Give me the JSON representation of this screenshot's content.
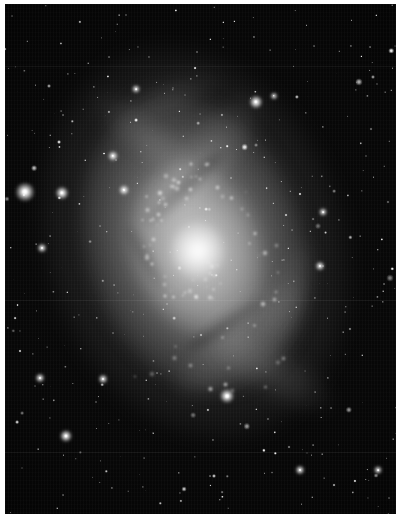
{
  "image": {
    "kind": "astronomical-photograph",
    "subject": "spiral galaxy",
    "common_name": "Triangulum Galaxy",
    "catalog_designation": "M33",
    "color_mode": "grayscale",
    "caption": "",
    "width_px": 404,
    "height_px": 521
  },
  "frame": {
    "border_color": "#ffffff",
    "border_left_px": 5,
    "border_top_px": 4,
    "border_right_px": 8,
    "border_bottom_px": 7,
    "sky_background_color": "#000000"
  },
  "palette": {
    "sky": "#000000",
    "sky_noise": "#0a0a0a",
    "galaxy_outer_halo": "#6a6a6a",
    "galaxy_mid_disk": "#a8a8a8",
    "galaxy_inner_disk": "#d2d2d2",
    "galaxy_core": "#ffffff",
    "dust_lane": "#1a1a1a",
    "star_white": "#ffffff"
  },
  "galaxy": {
    "label": "M33 spiral galaxy",
    "center_x": 196,
    "center_y": 258,
    "major_axis_px": 300,
    "minor_axis_px": 212,
    "position_angle_deg": -18,
    "core": {
      "label": "galactic nucleus",
      "x": 196,
      "y": 253,
      "radius_px": 22,
      "peak_brightness": 255
    },
    "arms": [
      {
        "name": "north-east arm",
        "cx": 52,
        "cy": 30,
        "w": 150,
        "h": 58,
        "rot": -52,
        "opacity": 0.44
      },
      {
        "name": "north-west arm",
        "cx": 36,
        "cy": 26,
        "w": 126,
        "h": 46,
        "rot": 38,
        "opacity": 0.4
      },
      {
        "name": "south-west arm",
        "cx": 60,
        "cy": 66,
        "w": 162,
        "h": 60,
        "rot": -40,
        "opacity": 0.42
      },
      {
        "name": "south-east arm",
        "cx": 68,
        "cy": 72,
        "w": 140,
        "h": 52,
        "rot": 30,
        "opacity": 0.38
      },
      {
        "name": "outer eastern arm",
        "cx": 72,
        "cy": 58,
        "w": 118,
        "h": 44,
        "rot": -70,
        "opacity": 0.3
      },
      {
        "name": "outer northern spur",
        "cx": 42,
        "cy": 18,
        "w": 104,
        "h": 38,
        "rot": -18,
        "opacity": 0.28
      }
    ],
    "dust_lanes": [
      {
        "name": "inner north dust lane",
        "cx": 46,
        "cy": 36,
        "w": 104,
        "h": 17,
        "rot": -44
      },
      {
        "name": "inner south dust lane",
        "cx": 56,
        "cy": 63,
        "w": 92,
        "h": 15,
        "rot": -34
      },
      {
        "name": "western dust lane",
        "cx": 36,
        "cy": 50,
        "w": 74,
        "h": 13,
        "rot": 62
      }
    ]
  },
  "features": {
    "bright_stars_label": "foreground stars",
    "bright_stars": [
      {
        "id": "star-west-bright",
        "x": 25,
        "y": 192,
        "size": 19,
        "magnitude_rank": 1
      },
      {
        "id": "star-west-companion",
        "x": 62,
        "y": 193,
        "size": 13,
        "magnitude_rank": 2
      },
      {
        "id": "star-north-east-bright",
        "x": 256,
        "y": 102,
        "size": 13,
        "magnitude_rank": 3
      },
      {
        "id": "star-south-central",
        "x": 227,
        "y": 396,
        "size": 14,
        "magnitude_rank": 2
      },
      {
        "id": "star-south-west",
        "x": 66,
        "y": 436,
        "size": 12,
        "magnitude_rank": 4
      },
      {
        "id": "star-north-west-arm",
        "x": 124,
        "y": 190,
        "size": 10,
        "magnitude_rank": 5
      },
      {
        "id": "star-west-disk-edge",
        "x": 113,
        "y": 156,
        "size": 10,
        "magnitude_rank": 5
      },
      {
        "id": "star-far-west-mid",
        "x": 42,
        "y": 248,
        "size": 9,
        "magnitude_rank": 6
      },
      {
        "id": "star-south-west-low",
        "x": 40,
        "y": 378,
        "size": 9,
        "magnitude_rank": 6
      },
      {
        "id": "star-south-mid-west",
        "x": 103,
        "y": 379,
        "size": 9,
        "magnitude_rank": 6
      },
      {
        "id": "star-east-mid",
        "x": 320,
        "y": 266,
        "size": 9,
        "magnitude_rank": 6
      },
      {
        "id": "star-east-high",
        "x": 323,
        "y": 212,
        "size": 8,
        "magnitude_rank": 7
      },
      {
        "id": "star-south-east-low",
        "x": 300,
        "y": 470,
        "size": 9,
        "magnitude_rank": 6
      },
      {
        "id": "star-far-east-low",
        "x": 378,
        "y": 470,
        "size": 8,
        "magnitude_rank": 7
      },
      {
        "id": "star-north-centre",
        "x": 136,
        "y": 89,
        "size": 8,
        "magnitude_rank": 7
      },
      {
        "id": "star-north-east-high",
        "x": 274,
        "y": 96,
        "size": 7,
        "magnitude_rank": 8
      }
    ],
    "hii_regions_label": "H II regions and star clusters",
    "hii_region_count": 84,
    "field_star_count": 430,
    "plate_seams_y": [
      66,
      300,
      452
    ]
  },
  "annotations": {
    "text_overlays": [],
    "scale_bar": null,
    "compass": null
  }
}
